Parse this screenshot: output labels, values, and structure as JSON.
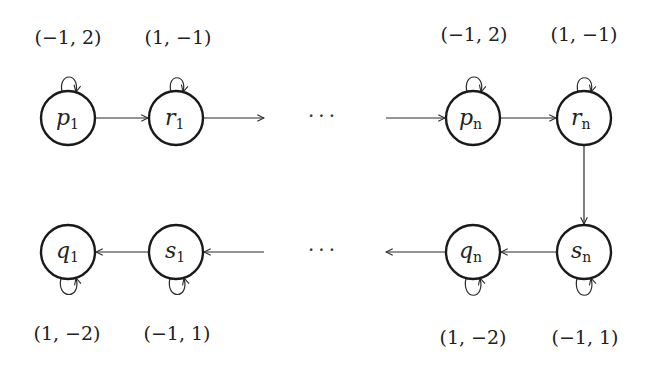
{
  "diagram": {
    "nodes": [
      {
        "id": "p1",
        "base": "p",
        "sub": "1",
        "x": 68,
        "y": 118,
        "weight": "(−1, 2)",
        "loop": "top"
      },
      {
        "id": "r1",
        "base": "r",
        "sub": "1",
        "x": 176,
        "y": 118,
        "weight": "(1, −1)",
        "loop": "top"
      },
      {
        "id": "pn",
        "base": "p",
        "sub": "n",
        "x": 473,
        "y": 118,
        "weight": "(−1, 2)",
        "loop": "top"
      },
      {
        "id": "rn",
        "base": "r",
        "sub": "n",
        "x": 584,
        "y": 118,
        "weight": "(1, −1)",
        "loop": "top"
      },
      {
        "id": "q1",
        "base": "q",
        "sub": "1",
        "x": 68,
        "y": 252,
        "weight": "(1, −2)",
        "loop": "bottom"
      },
      {
        "id": "s1",
        "base": "s",
        "sub": "1",
        "x": 176,
        "y": 252,
        "weight": "(−1, 1)",
        "loop": "bottom"
      },
      {
        "id": "qn",
        "base": "q",
        "sub": "n",
        "x": 473,
        "y": 252,
        "weight": "(1, −2)",
        "loop": "bottom"
      },
      {
        "id": "sn",
        "base": "s",
        "sub": "n",
        "x": 584,
        "y": 252,
        "weight": "(−1, 1)",
        "loop": "bottom"
      }
    ],
    "edges": [
      {
        "from": "p1",
        "to": "r1"
      },
      {
        "from": "r1",
        "to": "ellipsis-top"
      },
      {
        "from": "ellipsis-top",
        "to": "pn"
      },
      {
        "from": "pn",
        "to": "rn"
      },
      {
        "from": "rn",
        "to": "sn"
      },
      {
        "from": "sn",
        "to": "qn"
      },
      {
        "from": "qn",
        "to": "ellipsis-bottom"
      },
      {
        "from": "ellipsis-bottom",
        "to": "s1"
      },
      {
        "from": "s1",
        "to": "q1"
      }
    ],
    "ellipsis_top": "···",
    "ellipsis_bottom": "···"
  }
}
